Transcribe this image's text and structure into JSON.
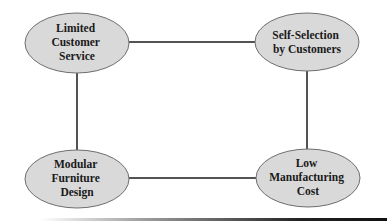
{
  "diagram": {
    "type": "concept-map",
    "colors": {
      "node_fill": "#d9d9d9",
      "node_stroke": "#6e6e6e",
      "edge": "#1a1a1a",
      "text": "#1a1a1a"
    },
    "nodes": [
      {
        "id": "limited-customer-service",
        "lines": [
          "Limited",
          "Customer",
          "Service"
        ],
        "cx": 77,
        "cy": 43
      },
      {
        "id": "self-selection-by-customers",
        "lines": [
          "Self-Selection",
          "by Customers"
        ],
        "cx": 307,
        "cy": 42
      },
      {
        "id": "modular-furniture-design",
        "lines": [
          "Modular",
          "Furniture",
          "Design"
        ],
        "cx": 77,
        "cy": 179
      },
      {
        "id": "low-manufacturing-cost",
        "lines": [
          "Low",
          "Manufacturing",
          "Cost"
        ],
        "cx": 308,
        "cy": 178
      }
    ],
    "edges": [
      {
        "from": "limited-customer-service",
        "to": "self-selection-by-customers"
      },
      {
        "from": "limited-customer-service",
        "to": "modular-furniture-design"
      },
      {
        "from": "self-selection-by-customers",
        "to": "low-manufacturing-cost"
      },
      {
        "from": "modular-furniture-design",
        "to": "low-manufacturing-cost"
      }
    ]
  }
}
